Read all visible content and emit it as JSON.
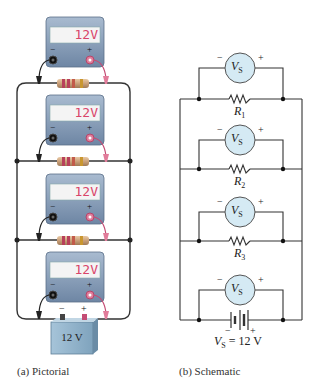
{
  "pictorial": {
    "caption": "(a) Pictorial",
    "meters": [
      {
        "reading": "12V",
        "minus": "−",
        "plus": "+"
      },
      {
        "reading": "12V",
        "minus": "−",
        "plus": "+"
      },
      {
        "reading": "12V",
        "minus": "−",
        "plus": "+"
      },
      {
        "reading": "12V",
        "minus": "−",
        "plus": "+"
      }
    ],
    "battery": {
      "label": "12 V",
      "minus": "−",
      "plus": "+"
    }
  },
  "schematic": {
    "caption": "(b) Schematic",
    "meter_label": "V",
    "meter_sub": "S",
    "minus": "−",
    "plus": "+",
    "resistors": [
      {
        "name": "R",
        "sub": "1"
      },
      {
        "name": "R",
        "sub": "2"
      },
      {
        "name": "R",
        "sub": "3"
      }
    ],
    "source": {
      "name": "V",
      "sub": "S",
      "value": " = 12 V"
    }
  },
  "colors": {
    "meter_body": "#7f97b4",
    "display_text": "#d9456a",
    "circle_fill": "#d5eaf4",
    "wire": "#333333",
    "battery_body": "#8fb3cc"
  }
}
